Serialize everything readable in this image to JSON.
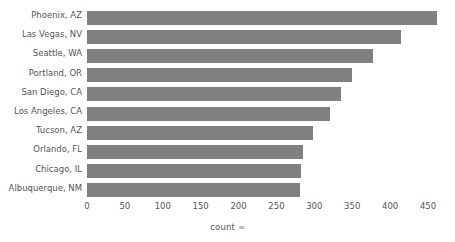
{
  "chart_data": {
    "type": "bar",
    "orientation": "horizontal",
    "title": "",
    "xlabel": "count",
    "xlabel_suffix": "≡",
    "ylabel": "",
    "categories": [
      "Phoenix, AZ",
      "Las Vegas, NV",
      "Seattle, WA",
      "Portland, OR",
      "San Diego, CA",
      "Los Angeles, CA",
      "Tucson, AZ",
      "Orlando, FL",
      "Chicago, IL",
      "Albuquerque, NM"
    ],
    "values": [
      462,
      415,
      378,
      350,
      335,
      321,
      298,
      285,
      283,
      281
    ],
    "xlim": [
      0,
      450
    ],
    "xticks": [
      0,
      50,
      100,
      150,
      200,
      250,
      300,
      350,
      400,
      450
    ],
    "xtick_labels": [
      "0",
      "50",
      "100",
      "150",
      "200",
      "250",
      "300",
      "350",
      "400",
      "450"
    ],
    "grid": false,
    "legend": false,
    "bar_color": "#808080",
    "text_color": "#555555",
    "background_color": "#ffffff"
  }
}
